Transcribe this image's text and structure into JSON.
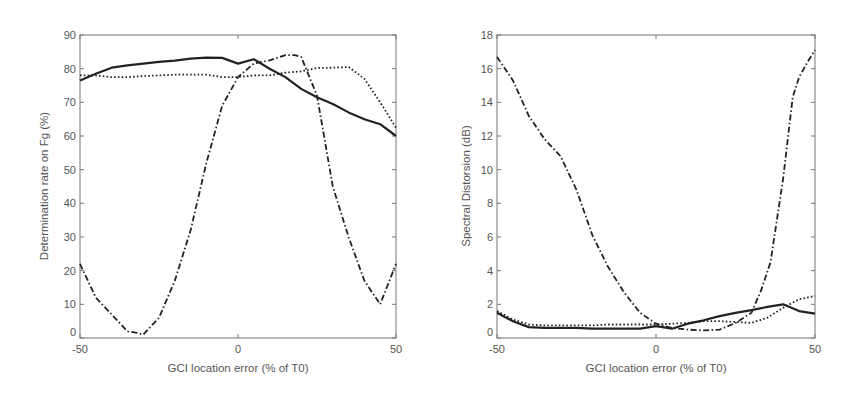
{
  "chart_data": [
    {
      "type": "line",
      "title": "",
      "xlabel": "GCI location error (% of T0)",
      "ylabel": "Determination rate on Fg (%)",
      "xlim": [
        -50,
        50
      ],
      "ylim": [
        0,
        90
      ],
      "xticks": [
        -50,
        0,
        50
      ],
      "yticks": [
        0,
        10,
        20,
        30,
        40,
        50,
        60,
        70,
        80,
        90
      ],
      "grid": false,
      "legend": null,
      "series": [
        {
          "name": "solid",
          "style": "solid",
          "x": [
            -50,
            -45,
            -40,
            -35,
            -30,
            -25,
            -20,
            -15,
            -10,
            -5,
            0,
            5,
            10,
            15,
            20,
            25,
            30,
            35,
            40,
            45,
            50
          ],
          "values": [
            76.5,
            78.5,
            80.3,
            81,
            81.5,
            82,
            82.4,
            83,
            83.3,
            83.2,
            81.5,
            82.8,
            80,
            77.5,
            74,
            71.5,
            69.5,
            67,
            65,
            63.5,
            60
          ]
        },
        {
          "name": "dotted",
          "style": "dotted",
          "x": [
            -50,
            -45,
            -40,
            -35,
            -30,
            -25,
            -20,
            -15,
            -10,
            -5,
            0,
            5,
            10,
            15,
            20,
            25,
            30,
            35,
            40,
            45,
            50
          ],
          "values": [
            78,
            78,
            77.5,
            77.5,
            77.8,
            78,
            78.2,
            78.2,
            78.2,
            77.5,
            77.5,
            78,
            78,
            78.8,
            79.2,
            80.2,
            80.3,
            80.5,
            77,
            70,
            62.5
          ]
        },
        {
          "name": "dash-dot",
          "style": "dashdot",
          "x": [
            -50,
            -45,
            -40,
            -35,
            -32,
            -30,
            -25,
            -20,
            -15,
            -10,
            -5,
            0,
            5,
            10,
            15,
            18,
            20,
            25,
            30,
            35,
            40,
            45,
            50
          ],
          "values": [
            22,
            12,
            7,
            2,
            1.5,
            1,
            6,
            17,
            32,
            52,
            69,
            77.5,
            81.5,
            82.5,
            84,
            84,
            83.5,
            72,
            45,
            30,
            17,
            10,
            22
          ]
        }
      ]
    },
    {
      "type": "line",
      "title": "",
      "xlabel": "GCI location error (% of T0)",
      "ylabel": "Spectral Distorsion (dB)",
      "xlim": [
        -50,
        50
      ],
      "ylim": [
        0,
        18
      ],
      "xticks": [
        -50,
        0,
        50
      ],
      "yticks": [
        0,
        2,
        4,
        6,
        8,
        10,
        12,
        14,
        16,
        18
      ],
      "grid": false,
      "legend": null,
      "series": [
        {
          "name": "solid",
          "style": "solid",
          "x": [
            -50,
            -45,
            -40,
            -35,
            -30,
            -25,
            -20,
            -15,
            -10,
            -5,
            0,
            5,
            10,
            15,
            20,
            25,
            30,
            35,
            40,
            45,
            50
          ],
          "values": [
            1.5,
            1.0,
            0.65,
            0.6,
            0.6,
            0.6,
            0.55,
            0.55,
            0.55,
            0.55,
            0.7,
            0.55,
            0.85,
            1.05,
            1.3,
            1.5,
            1.65,
            1.85,
            2.0,
            1.6,
            1.45
          ]
        },
        {
          "name": "dotted",
          "style": "dotted",
          "x": [
            -50,
            -45,
            -40,
            -35,
            -30,
            -25,
            -20,
            -15,
            -10,
            -5,
            0,
            5,
            10,
            15,
            20,
            25,
            30,
            35,
            40,
            45,
            50
          ],
          "values": [
            1.6,
            1.1,
            0.8,
            0.75,
            0.75,
            0.75,
            0.75,
            0.8,
            0.8,
            0.8,
            0.8,
            0.85,
            0.9,
            1.0,
            1.0,
            0.95,
            0.9,
            1.2,
            1.8,
            2.3,
            2.5
          ]
        },
        {
          "name": "dash-dot",
          "style": "dashdot",
          "x": [
            -50,
            -45,
            -40,
            -35,
            -30,
            -25,
            -20,
            -15,
            -10,
            -5,
            0,
            5,
            10,
            15,
            20,
            25,
            30,
            33,
            36,
            40,
            43,
            45,
            48,
            50
          ],
          "values": [
            16.7,
            15.3,
            13.2,
            11.8,
            10.8,
            8.8,
            6.1,
            4.2,
            2.7,
            1.5,
            0.85,
            0.6,
            0.5,
            0.45,
            0.5,
            0.9,
            1.5,
            2.8,
            4.5,
            9.5,
            14.3,
            15.5,
            16.5,
            17.1
          ]
        }
      ]
    }
  ],
  "plots": [
    {
      "ylabel": "Determination rate on Fg (%)",
      "xlabel": "GCI location error (% of T0)",
      "yticks": [
        "0",
        "10",
        "20",
        "30",
        "40",
        "50",
        "60",
        "70",
        "80",
        "90"
      ],
      "xticks": [
        "-50",
        "0",
        "50"
      ]
    },
    {
      "ylabel": "Spectral Distorsion (dB)",
      "xlabel": "GCI location error (% of T0)",
      "yticks": [
        "0",
        "2",
        "4",
        "6",
        "8",
        "10",
        "12",
        "14",
        "16",
        "18"
      ],
      "xticks": [
        "-50",
        "0",
        "50"
      ]
    }
  ],
  "colors": {
    "line": "#222222",
    "axis": "#777777",
    "text": "#555555",
    "background": "#ffffff"
  }
}
